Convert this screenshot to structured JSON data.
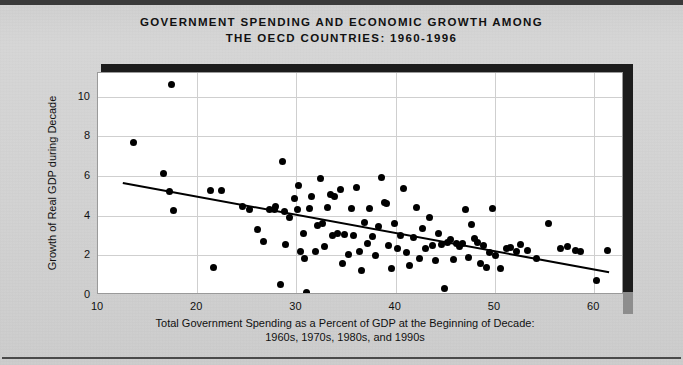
{
  "title": {
    "line1": "GOVERNMENT SPENDING AND ECONOMIC GROWTH AMONG",
    "line2": "THE OECD COUNTRIES: 1960-1996"
  },
  "axis_label_x_line1": "Total Government Spending as a Percent of GDP at the Beginning of Decade:",
  "axis_label_x_line2": "1960s, 1970s, 1980s, and 1990s",
  "axis_label_y": "Growth of Real GDP during Decade",
  "colors": {
    "page_background": "#d3d3d3",
    "plot_background": "#ffffff",
    "point": "#000000",
    "trendline": "#000000",
    "gridline": "#cfcfcf",
    "shadow": "#1c1c1c",
    "text": "#111111"
  },
  "chart_data": {
    "type": "scatter",
    "title": "GOVERNMENT SPENDING AND ECONOMIC GROWTH AMONG THE OECD COUNTRIES: 1960-1996",
    "xlabel": "Total Government Spending as a Percent of GDP at the Beginning of Decade: 1960s, 1970s, 1980s, and 1990s",
    "ylabel": "Growth of Real GDP during Decade",
    "xlim": [
      10,
      63
    ],
    "ylim": [
      0,
      11.2
    ],
    "xticks": [
      10,
      20,
      30,
      40,
      50,
      60
    ],
    "yticks": [
      0,
      2,
      4,
      6,
      8,
      10
    ],
    "grid": true,
    "legend": "none",
    "trendline": {
      "type": "linear-fit",
      "x_start": 12.5,
      "y_start": 5.65,
      "x_end": 61.5,
      "y_end": 1.15
    },
    "points": [
      [
        13.6,
        7.7
      ],
      [
        17.4,
        10.6
      ],
      [
        16.6,
        6.15
      ],
      [
        17.2,
        5.2
      ],
      [
        17.6,
        4.25
      ],
      [
        21.3,
        5.25
      ],
      [
        21.6,
        1.4
      ],
      [
        22.4,
        5.25
      ],
      [
        24.6,
        4.45
      ],
      [
        25.3,
        4.3
      ],
      [
        26.1,
        3.3
      ],
      [
        26.7,
        2.7
      ],
      [
        27.3,
        4.3
      ],
      [
        27.8,
        4.3
      ],
      [
        27.9,
        4.45
      ],
      [
        28.4,
        0.55
      ],
      [
        28.6,
        6.75
      ],
      [
        28.8,
        4.2
      ],
      [
        28.9,
        2.55
      ],
      [
        29.3,
        3.9
      ],
      [
        29.8,
        4.85
      ],
      [
        30.1,
        4.3
      ],
      [
        30.2,
        5.5
      ],
      [
        30.4,
        2.2
      ],
      [
        30.7,
        3.1
      ],
      [
        30.8,
        1.85
      ],
      [
        31.0,
        0.15
      ],
      [
        31.3,
        4.35
      ],
      [
        31.5,
        4.95
      ],
      [
        31.9,
        2.2
      ],
      [
        32.1,
        3.5
      ],
      [
        32.4,
        5.9
      ],
      [
        32.6,
        3.6
      ],
      [
        32.8,
        2.45
      ],
      [
        33.1,
        4.4
      ],
      [
        33.4,
        5.05
      ],
      [
        33.6,
        3.0
      ],
      [
        33.8,
        4.95
      ],
      [
        34.1,
        3.1
      ],
      [
        34.4,
        5.3
      ],
      [
        34.6,
        1.6
      ],
      [
        34.8,
        3.05
      ],
      [
        35.2,
        2.05
      ],
      [
        35.5,
        4.35
      ],
      [
        35.7,
        3.0
      ],
      [
        36.0,
        5.4
      ],
      [
        36.3,
        2.2
      ],
      [
        36.5,
        1.25
      ],
      [
        36.9,
        3.65
      ],
      [
        37.2,
        2.6
      ],
      [
        37.4,
        4.35
      ],
      [
        37.7,
        2.95
      ],
      [
        38.0,
        2.0
      ],
      [
        38.3,
        3.45
      ],
      [
        38.6,
        5.95
      ],
      [
        38.9,
        4.65
      ],
      [
        39.1,
        4.6
      ],
      [
        39.3,
        2.5
      ],
      [
        39.6,
        1.35
      ],
      [
        39.9,
        3.6
      ],
      [
        40.2,
        2.35
      ],
      [
        40.5,
        3.0
      ],
      [
        40.8,
        5.35
      ],
      [
        41.1,
        2.15
      ],
      [
        41.4,
        1.5
      ],
      [
        41.8,
        2.9
      ],
      [
        42.1,
        4.4
      ],
      [
        42.4,
        1.85
      ],
      [
        42.7,
        3.35
      ],
      [
        43.0,
        2.35
      ],
      [
        43.4,
        3.9
      ],
      [
        43.7,
        2.5
      ],
      [
        44.0,
        1.75
      ],
      [
        44.3,
        3.1
      ],
      [
        44.6,
        2.55
      ],
      [
        44.9,
        0.35
      ],
      [
        45.2,
        2.65
      ],
      [
        45.5,
        2.8
      ],
      [
        45.8,
        1.8
      ],
      [
        46.1,
        2.6
      ],
      [
        46.4,
        2.45
      ],
      [
        46.7,
        2.6
      ],
      [
        47.0,
        4.3
      ],
      [
        47.3,
        1.9
      ],
      [
        47.6,
        3.55
      ],
      [
        47.9,
        2.85
      ],
      [
        48.2,
        2.65
      ],
      [
        48.5,
        1.6
      ],
      [
        48.8,
        2.5
      ],
      [
        49.1,
        1.4
      ],
      [
        49.4,
        2.15
      ],
      [
        49.7,
        4.35
      ],
      [
        50.1,
        2.0
      ],
      [
        50.6,
        1.35
      ],
      [
        51.2,
        2.35
      ],
      [
        51.6,
        2.4
      ],
      [
        52.2,
        2.2
      ],
      [
        52.6,
        2.55
      ],
      [
        53.3,
        2.25
      ],
      [
        54.2,
        1.85
      ],
      [
        55.4,
        3.6
      ],
      [
        56.6,
        2.35
      ],
      [
        57.3,
        2.45
      ],
      [
        58.1,
        2.25
      ],
      [
        58.6,
        2.2
      ],
      [
        61.3,
        2.25
      ],
      [
        60.2,
        0.75
      ]
    ]
  }
}
